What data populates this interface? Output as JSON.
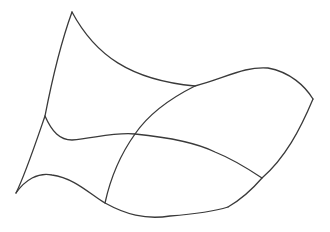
{
  "diagram": {
    "background": "#ffffff",
    "stroke_color": "#3a3a3a",
    "stroke_width": 1.3,
    "curves": [
      {
        "name": "top-boundary",
        "d": "M72,12 C95,55 130,80 195,86 C225,78 245,66 268,68 C290,72 305,86 313,99"
      },
      {
        "name": "left-boundary",
        "d": "M72,12 C60,45 52,80 45,116 C35,145 25,175 16,193"
      },
      {
        "name": "right-boundary",
        "d": "M313,99 C300,130 285,158 262,178 C250,192 240,200 228,207"
      },
      {
        "name": "bottom-boundary",
        "d": "M16,193 C25,180 38,172 52,175 C75,178 92,196 105,203 C125,214 145,220 170,216 C195,214 212,212 228,207"
      },
      {
        "name": "middle-u-curve",
        "d": "M45,116 C52,132 60,140 72,140 C95,138 115,132 135,134 C165,137 195,142 215,152 C235,160 250,170 262,178"
      },
      {
        "name": "middle-v-curve",
        "d": "M195,86 C175,96 150,112 135,134 C120,155 110,180 105,203"
      }
    ]
  }
}
